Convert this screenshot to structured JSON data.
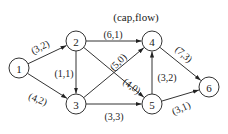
{
  "diagram": {
    "title": "(cap,flow)",
    "colors": {
      "stroke": "#333333",
      "text": "#222222",
      "background": "#ffffff"
    },
    "nodes": [
      {
        "id": "1",
        "label": "1",
        "x": 19,
        "y": 68
      },
      {
        "id": "2",
        "label": "2",
        "x": 76,
        "y": 41
      },
      {
        "id": "3",
        "label": "3",
        "x": 76,
        "y": 104
      },
      {
        "id": "4",
        "label": "4",
        "x": 152,
        "y": 41
      },
      {
        "id": "5",
        "label": "5",
        "x": 152,
        "y": 104
      },
      {
        "id": "6",
        "label": "6",
        "x": 209,
        "y": 87
      }
    ],
    "edges": [
      {
        "from": "1",
        "to": "2",
        "label": "(3,2)",
        "lx": 40,
        "ly": 47,
        "rot": -28
      },
      {
        "from": "1",
        "to": "3",
        "label": "(4,2)",
        "lx": 38,
        "ly": 99,
        "rot": 22
      },
      {
        "from": "2",
        "to": "3",
        "label": "(1,1)",
        "lx": 64,
        "ly": 73,
        "rot": 0
      },
      {
        "from": "2",
        "to": "4",
        "label": "(6,1)",
        "lx": 113,
        "ly": 34,
        "rot": 0
      },
      {
        "from": "2",
        "to": "5",
        "label": "(4,0)",
        "lx": 132,
        "ly": 86,
        "rot": 35
      },
      {
        "from": "3",
        "to": "4",
        "label": "(5,0)",
        "lx": 118,
        "ly": 62,
        "rot": -45
      },
      {
        "from": "3",
        "to": "5",
        "label": "(3,3)",
        "lx": 114,
        "ly": 116,
        "rot": 0
      },
      {
        "from": "5",
        "to": "4",
        "label": "(3,2)",
        "lx": 167,
        "ly": 77,
        "rot": 0
      },
      {
        "from": "4",
        "to": "6",
        "label": "(7,3)",
        "lx": 184,
        "ly": 54,
        "rot": 42
      },
      {
        "from": "5",
        "to": "6",
        "label": "(3,1)",
        "lx": 181,
        "ly": 108,
        "rot": -25
      }
    ]
  }
}
